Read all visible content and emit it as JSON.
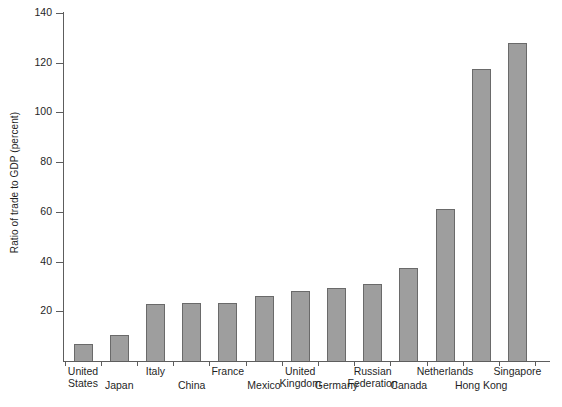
{
  "chart_data": {
    "type": "bar",
    "title": "",
    "xlabel": "",
    "ylabel": "Ratio of trade to GDP (percent)",
    "categories": [
      "United States",
      "Japan",
      "Italy",
      "China",
      "France",
      "Mexico",
      "United Kingdom",
      "Germany",
      "Russian Federation",
      "Canada",
      "Netherlands",
      "Hong Kong",
      "Singapore"
    ],
    "values": [
      7,
      10.5,
      23,
      23.3,
      23.3,
      26,
      28,
      29.5,
      31,
      37.5,
      61,
      117.5,
      128
    ],
    "ylim": [
      0,
      140
    ],
    "ytick_values": [
      0,
      20,
      40,
      60,
      80,
      100,
      120,
      140
    ],
    "ytick_labels": [
      "",
      "20",
      "40",
      "60",
      "80",
      "100",
      "120",
      "140"
    ],
    "grid": false,
    "legend": "none",
    "bar_color": "#9e9e9e",
    "bar_border_color": "#6a6a6a",
    "axis_color": "#5d5d5d"
  },
  "axis": {
    "y_title": "Ratio of trade to GDP (percent)"
  }
}
